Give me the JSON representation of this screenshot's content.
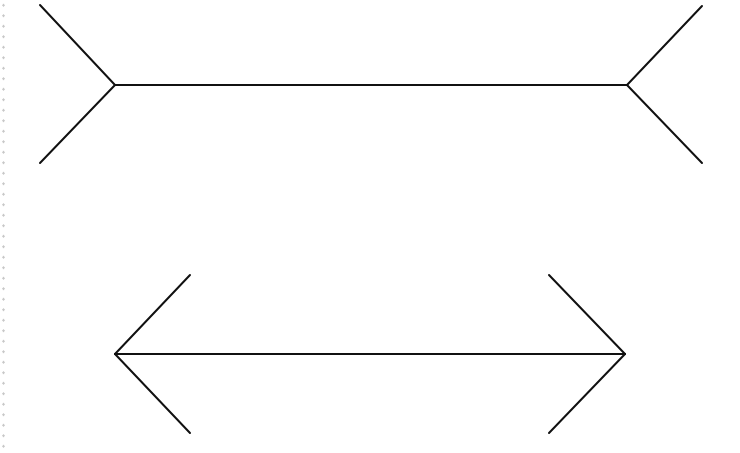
{
  "colors": {
    "line": "#111111",
    "background": "#ffffff",
    "edge_dots": "#c8c8c8"
  },
  "figures": [
    {
      "name": "fins-out",
      "shaft": {
        "x1": 115,
        "y1": 85,
        "x2": 627,
        "y2": 85
      },
      "fins": [
        {
          "x1": 115,
          "y1": 85,
          "x2": 40,
          "y2": 5
        },
        {
          "x1": 115,
          "y1": 85,
          "x2": 40,
          "y2": 163
        },
        {
          "x1": 627,
          "y1": 85,
          "x2": 702,
          "y2": 6
        },
        {
          "x1": 627,
          "y1": 85,
          "x2": 702,
          "y2": 163
        }
      ]
    },
    {
      "name": "fins-in",
      "shaft": {
        "x1": 115,
        "y1": 354,
        "x2": 625,
        "y2": 354
      },
      "fins": [
        {
          "x1": 115,
          "y1": 354,
          "x2": 190,
          "y2": 275
        },
        {
          "x1": 115,
          "y1": 354,
          "x2": 190,
          "y2": 433
        },
        {
          "x1": 625,
          "y1": 354,
          "x2": 549,
          "y2": 275
        },
        {
          "x1": 625,
          "y1": 354,
          "x2": 549,
          "y2": 433
        }
      ]
    }
  ]
}
